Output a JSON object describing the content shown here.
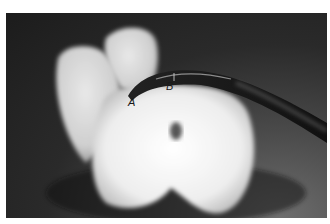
{
  "image": {
    "description": "Photograph of a molar tooth model with a curved dental instrument tip placed at the furcation",
    "labels": [
      {
        "id": "A",
        "text": "A"
      },
      {
        "id": "B",
        "text": "B"
      }
    ]
  }
}
